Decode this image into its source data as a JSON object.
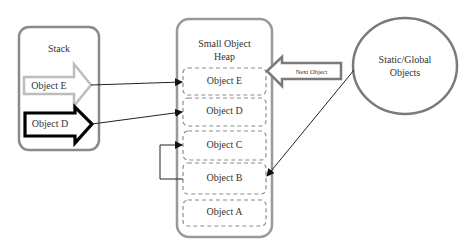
{
  "stack": {
    "title": "Stack",
    "items": [
      {
        "label": "Object E",
        "style": "light-outline"
      },
      {
        "label": "Object D",
        "style": "bold-outline"
      }
    ]
  },
  "heap": {
    "title_line1": "Small Object",
    "title_line2": "Heap",
    "objects": [
      {
        "label": "Object E"
      },
      {
        "label": "Object D"
      },
      {
        "label": "Object C"
      },
      {
        "label": "Object B"
      },
      {
        "label": "Object A"
      }
    ],
    "next_object_label": "Next Object"
  },
  "static_global": {
    "line1": "Static/Global",
    "line2": "Objects"
  },
  "colors": {
    "container_border": "#8a8a8a",
    "light_arrow": "#bdbdbd",
    "bold_arrow": "#000000",
    "dashed_border": "#8c8c8c",
    "connector": "#222222"
  }
}
